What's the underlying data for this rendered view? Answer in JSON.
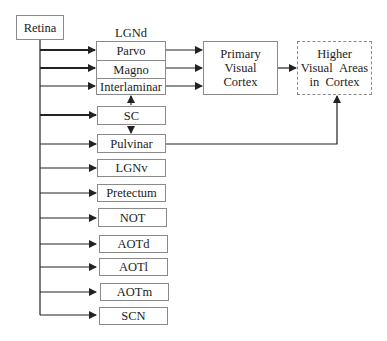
{
  "diagram": {
    "source": {
      "label": "Retina"
    },
    "lgnd": {
      "title": "LGNd",
      "rows": [
        {
          "label": "Parvo"
        },
        {
          "label": "Magno"
        },
        {
          "label": "Interlaminar"
        }
      ]
    },
    "primary": {
      "lines": [
        "Primary",
        "Visual",
        "Cortex"
      ]
    },
    "higher": {
      "lines": [
        "Higher",
        "Visual Areas",
        "in Cortex"
      ]
    },
    "targets": [
      {
        "label": "SC"
      },
      {
        "label": "Pulvinar"
      },
      {
        "label": "LGNv"
      },
      {
        "label": "Pretectum"
      },
      {
        "label": "NOT"
      },
      {
        "label": "AOTd"
      },
      {
        "label": "AOTl"
      },
      {
        "label": "AOTm"
      },
      {
        "label": "SCN"
      }
    ],
    "colors": {
      "line": "#222222",
      "border": "#8a8a8a"
    }
  }
}
